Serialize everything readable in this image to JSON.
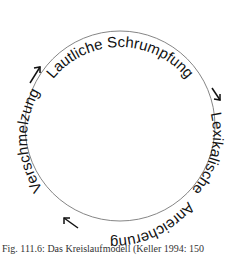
{
  "diagram": {
    "type": "cycle",
    "stages": [
      "Lautliche Schrumpfung",
      "Lexikalische Anreicherung",
      "Verschmelzung"
    ],
    "arrows": [
      "↘ top-right",
      "↙ bottom-left",
      "↗ top-left"
    ],
    "caption": "Fig. 111.6: Das Kreislaufmodell (Keller 1994: 150"
  }
}
